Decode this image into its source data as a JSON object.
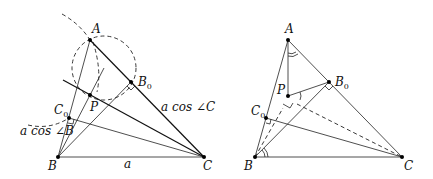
{
  "figures": [
    {
      "id": "left",
      "points": {
        "A": {
          "label": "A",
          "x": 90,
          "y": 40
        },
        "B0": {
          "label": "B",
          "sub": "0",
          "x": 131,
          "y": 82
        },
        "P": {
          "label": "P",
          "x": 90,
          "y": 95
        },
        "C0": {
          "label": "C",
          "sub": "0",
          "x": 69,
          "y": 118
        },
        "B": {
          "label": "B",
          "x": 58,
          "y": 157
        },
        "C": {
          "label": "C",
          "x": 204,
          "y": 157
        }
      },
      "annotations": {
        "side_a": "a",
        "cos_C": "a cos ∠C",
        "cos_B": "a cos ∠B"
      }
    },
    {
      "id": "right",
      "points": {
        "A": {
          "label": "A",
          "x": 288,
          "y": 40
        },
        "B0": {
          "label": "B",
          "sub": "0",
          "x": 329,
          "y": 82
        },
        "P": {
          "label": "P",
          "x": 288,
          "y": 96
        },
        "C0": {
          "label": "C",
          "sub": "0",
          "x": 266,
          "y": 118
        },
        "B": {
          "label": "B",
          "x": 255,
          "y": 157
        },
        "C": {
          "label": "C",
          "x": 402,
          "y": 157
        }
      }
    }
  ],
  "labels": {
    "L_A": "A",
    "L_B0": "B",
    "L_B0_sub": "0",
    "L_P": "P",
    "L_C0": "C",
    "L_C0_sub": "0",
    "L_B": "B",
    "L_C": "C",
    "L_a": "a",
    "L_cosC": "a cos ∠C",
    "L_cosB": "a cos ∠B",
    "R_A": "A",
    "R_B0": "B",
    "R_B0_sub": "0",
    "R_P": "P",
    "R_C0": "C",
    "R_C0_sub": "0",
    "R_B": "B",
    "R_C": "C"
  }
}
